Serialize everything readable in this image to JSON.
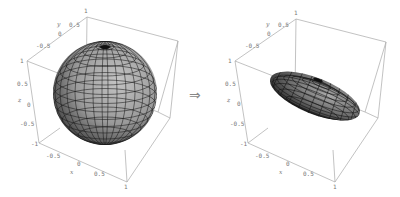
{
  "figure": {
    "arrow_symbol": "⇒",
    "panels": [
      {
        "name": "sphere",
        "axes": {
          "x_label": "x",
          "y_label": "y",
          "z_label": "z",
          "x_ticks": [
            "-0.5",
            "0",
            "0.5",
            "1"
          ],
          "y_ticks": [
            "-0.5",
            "0",
            "0.5",
            "1"
          ],
          "z_ticks": [
            "1",
            "0.5",
            "0",
            "-0.5",
            "-1"
          ],
          "x_range": [
            -1,
            1
          ],
          "y_range": [
            -1,
            1
          ],
          "z_range": [
            -1,
            1
          ]
        },
        "surface": "sphere"
      },
      {
        "name": "ellipsoid",
        "axes": {
          "x_label": "x",
          "y_label": "y",
          "z_label": "z",
          "x_ticks": [
            "-0.5",
            "0",
            "0.5",
            "1"
          ],
          "y_ticks": [
            "-0.5",
            "0",
            "0.5",
            "1"
          ],
          "z_ticks": [
            "1",
            "0.5",
            "0",
            "-0.5",
            "-1"
          ],
          "x_range": [
            -1,
            1
          ],
          "y_range": [
            -1,
            1
          ],
          "z_range": [
            -1,
            1
          ]
        },
        "surface": "ellipsoid"
      }
    ]
  },
  "colors": {
    "box": "#a8a8a8",
    "tick_text": "#777777",
    "mesh": "#1a1a1a",
    "surface_light": "#b8b8b8",
    "surface_dark": "#2a2a2a"
  }
}
